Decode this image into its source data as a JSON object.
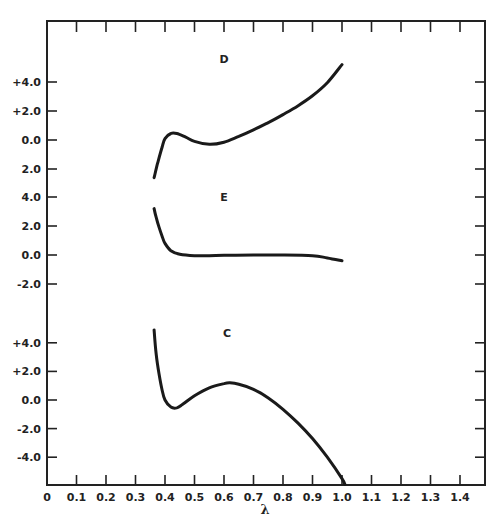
{
  "chart_data": {
    "type": "line",
    "title": "",
    "xlabel": "λ",
    "ylabel": "",
    "xlim": [
      0,
      1.5
    ],
    "x_ticks": [
      0,
      0.1,
      0.2,
      0.3,
      0.4,
      0.5,
      0.6,
      0.7,
      0.8,
      0.9,
      1.0,
      1.1,
      1.2,
      1.3,
      1.4
    ],
    "x_tick_labels": [
      "0",
      "0.1",
      "0.2",
      "0.3",
      "0.4",
      "0.5",
      "0.6",
      "0.7",
      "0.8",
      "0.9",
      "1.0",
      "1.1",
      "1.2",
      "1.3",
      "1.4"
    ],
    "grid": false,
    "legend": "none (curves labeled inline)",
    "panels": [
      {
        "name": "D",
        "y_tick_labels": [
          "+4.0",
          "+2.0",
          "0.0",
          "2.0"
        ],
        "y_ticks": [
          4.0,
          2.0,
          0.0,
          -2.0
        ],
        "label_pos": {
          "x": 0.6,
          "y": 5.6
        },
        "series": {
          "name": "D",
          "x": [
            0.363,
            0.375,
            0.39,
            0.4,
            0.42,
            0.44,
            0.47,
            0.5,
            0.55,
            0.6,
            0.65,
            0.7,
            0.75,
            0.8,
            0.85,
            0.9,
            0.95,
            1.0
          ],
          "y": [
            -2.6,
            -1.6,
            -0.5,
            0.1,
            0.45,
            0.45,
            0.2,
            -0.1,
            -0.3,
            -0.15,
            0.25,
            0.7,
            1.2,
            1.75,
            2.35,
            3.05,
            3.95,
            5.2
          ]
        }
      },
      {
        "name": "E",
        "y_tick_labels": [
          "4.0",
          "2.0",
          "0.0",
          "-2.0"
        ],
        "y_ticks": [
          4.0,
          2.0,
          0.0,
          -2.0
        ],
        "label_pos": {
          "x": 0.6,
          "y": 4.0
        },
        "series": {
          "name": "E",
          "x": [
            0.363,
            0.37,
            0.38,
            0.39,
            0.4,
            0.42,
            0.45,
            0.5,
            0.55,
            0.6,
            0.7,
            0.8,
            0.9,
            0.95,
            1.0
          ],
          "y": [
            3.2,
            2.6,
            1.9,
            1.3,
            0.8,
            0.3,
            0.05,
            -0.05,
            -0.05,
            -0.02,
            0.0,
            0.0,
            -0.05,
            -0.2,
            -0.4
          ]
        }
      },
      {
        "name": "C",
        "y_tick_labels": [
          "+4.0",
          "+2.0",
          "0.0",
          "-2.0",
          "-4.0"
        ],
        "y_ticks": [
          4.0,
          2.0,
          0.0,
          -2.0,
          -4.0
        ],
        "label_pos": {
          "x": 0.61,
          "y": 4.7
        },
        "series": {
          "name": "C",
          "x": [
            0.363,
            0.37,
            0.38,
            0.39,
            0.4,
            0.42,
            0.44,
            0.46,
            0.5,
            0.55,
            0.6,
            0.62,
            0.65,
            0.7,
            0.75,
            0.8,
            0.85,
            0.9,
            0.95,
            1.0,
            1.01
          ],
          "y": [
            4.9,
            3.2,
            1.8,
            0.7,
            0.0,
            -0.5,
            -0.55,
            -0.3,
            0.3,
            0.85,
            1.15,
            1.2,
            1.1,
            0.75,
            0.15,
            -0.65,
            -1.6,
            -2.7,
            -4.0,
            -5.5,
            -5.9
          ]
        }
      }
    ]
  },
  "labels": {
    "x_axis": "λ",
    "curve_d": "D",
    "curve_e": "E",
    "curve_c": "C"
  }
}
